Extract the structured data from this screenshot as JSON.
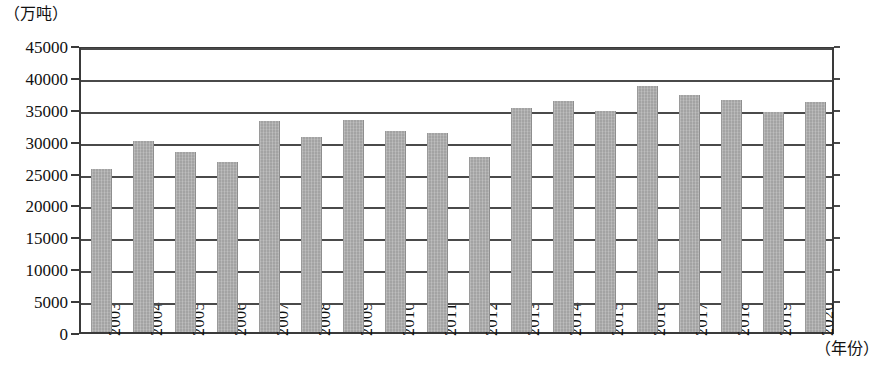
{
  "chart_data": {
    "type": "bar",
    "title": "",
    "subtitle": "",
    "xlabel": "（年份）",
    "ylabel": "（万吨）",
    "categories": [
      "2003",
      "2004",
      "2005",
      "2006",
      "2007",
      "2008",
      "2009",
      "2010",
      "2011",
      "2012",
      "2013",
      "2014",
      "2015",
      "2016",
      "2017",
      "2018",
      "2019",
      "2020"
    ],
    "values": [
      25500,
      30000,
      28200,
      26700,
      33100,
      30500,
      33200,
      31500,
      31200,
      27400,
      35100,
      36200,
      34600,
      38500,
      37100,
      36400,
      34500,
      36000
    ],
    "series": [
      {
        "name": "",
        "values": [
          25500,
          30000,
          28200,
          26700,
          33100,
          30500,
          33200,
          31500,
          31200,
          27400,
          35100,
          36200,
          34600,
          38500,
          37100,
          36400,
          34500,
          36000
        ]
      }
    ],
    "ylim": [
      0,
      45000
    ],
    "y_ticks": [
      0,
      5000,
      10000,
      15000,
      20000,
      25000,
      30000,
      35000,
      40000,
      45000
    ],
    "y_tick_labels": [
      "0",
      "5000",
      "10000",
      "15000",
      "20000",
      "25000",
      "30000",
      "35000",
      "40000",
      "45000"
    ],
    "grid": true,
    "grid_axis": "y",
    "legend": false,
    "legend_position": "none",
    "bar_color": "#a3a3a3",
    "axis_color": "#3a3a3a",
    "background_color": "#ffffff"
  },
  "axis": {
    "unit_label": "（万吨）",
    "x_axis_title": "（年份）"
  }
}
